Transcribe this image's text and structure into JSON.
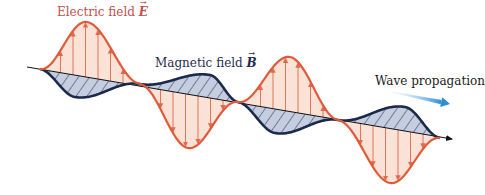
{
  "diagram": {
    "labels": {
      "electric": {
        "text": "Electric field ",
        "symbol": "E"
      },
      "magnetic": {
        "text": "Magnetic field ",
        "symbol": "B"
      },
      "propagation": {
        "text": "Wave propagation"
      }
    },
    "colors": {
      "electric_stroke": "#e05a3a",
      "electric_fill": "#f9ddd0",
      "electric_arrow": "#e06a4a",
      "magnetic_stroke": "#1b2a4a",
      "magnetic_fill": "#c5cde0",
      "hatch": "#1b2a4a",
      "axis": "#111111",
      "propagation_arrow": "#3a9ad9",
      "propagation_arrow_light": "#bfe0f5"
    },
    "axis": {
      "x1": 27,
      "y1": 67,
      "x2": 452,
      "y2": 139
    },
    "electric_wave": {
      "points": [
        [
          40,
          69
        ],
        [
          87,
          22
        ],
        [
          140,
          84
        ],
        [
          188,
          148
        ],
        [
          238,
          102
        ],
        [
          290,
          57
        ],
        [
          338,
          120
        ],
        [
          390,
          183
        ],
        [
          440,
          138
        ]
      ],
      "arrow_count_per_lobe": 7
    },
    "magnetic_wave": {
      "points": [
        [
          40,
          69
        ],
        [
          75,
          97
        ],
        [
          140,
          84
        ],
        [
          210,
          75
        ],
        [
          238,
          102
        ],
        [
          275,
          133
        ],
        [
          338,
          120
        ],
        [
          405,
          107
        ],
        [
          440,
          138
        ]
      ]
    },
    "propagation_arrow": {
      "x1": 392,
      "y1": 92,
      "x2": 450,
      "y2": 104
    }
  }
}
